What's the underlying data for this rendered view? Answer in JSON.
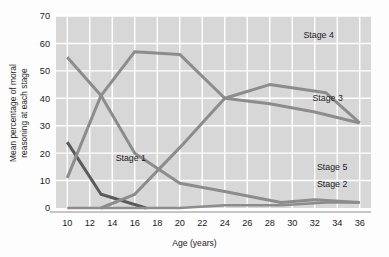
{
  "chart_data": {
    "type": "line",
    "title": "",
    "xlabel": "Age (years)",
    "ylabel": "Mean percentage of moral reasoning at each stage",
    "ylabel_line1": "Mean percentage of moral",
    "ylabel_line2": "reasoning at each stage",
    "xlim": [
      9,
      37
    ],
    "ylim": [
      0,
      70
    ],
    "xticks": [
      10,
      12,
      14,
      16,
      18,
      20,
      22,
      24,
      26,
      28,
      30,
      32,
      34,
      36
    ],
    "yticks": [
      0,
      10,
      20,
      30,
      40,
      50,
      60,
      70
    ],
    "grid": true,
    "legend_position": "inline-right",
    "plot_background": "#d7d7d7",
    "series": [
      {
        "name": "Stage 1",
        "label": "Stage 1",
        "color": "#5a5a5a",
        "label_x": 14.3,
        "label_y": 17,
        "x": [
          10,
          13,
          17
        ],
        "values": [
          24,
          5,
          0
        ]
      },
      {
        "name": "Stage 2",
        "label": "Stage 2",
        "color": "#8c8c8c",
        "label_x": 32.2,
        "label_y": 7.5,
        "x": [
          10,
          13,
          16,
          20,
          24,
          29,
          32,
          36
        ],
        "values": [
          55,
          41,
          20,
          9,
          6,
          2,
          3,
          2
        ]
      },
      {
        "name": "Stage 3",
        "label": "Stage 3",
        "color": "#8c8c8c",
        "label_x": 31.8,
        "label_y": 39,
        "x": [
          10,
          13,
          16,
          20,
          24,
          28,
          33,
          36
        ],
        "values": [
          11,
          41,
          57,
          56,
          40,
          45,
          42,
          31
        ]
      },
      {
        "name": "Stage 4",
        "label": "Stage 4",
        "color": "#8c8c8c",
        "label_x": 31.0,
        "label_y": 62,
        "x": [
          13,
          16,
          20,
          24,
          28,
          32,
          36
        ],
        "values": [
          0,
          5,
          22,
          40,
          38,
          35,
          31
        ]
      },
      {
        "name": "Stage 5",
        "label": "Stage 5",
        "color": "#8c8c8c",
        "label_x": 32.2,
        "label_y": 14,
        "x": [
          10,
          20,
          24,
          29,
          33,
          36
        ],
        "values": [
          0,
          0,
          1,
          1,
          2,
          2
        ]
      }
    ]
  },
  "axes": {
    "x_title": "Age (years)",
    "y_title_line1": "Mean percentage of moral",
    "y_title_line2": "reasoning at each stage",
    "x_tick_labels": [
      "10",
      "12",
      "14",
      "16",
      "18",
      "20",
      "22",
      "24",
      "26",
      "28",
      "30",
      "32",
      "34",
      "36"
    ],
    "y_tick_labels": [
      "0",
      "10",
      "20",
      "30",
      "40",
      "50",
      "60",
      "70"
    ]
  },
  "labels": {
    "stage1": "Stage 1",
    "stage2": "Stage 2",
    "stage3": "Stage 3",
    "stage4": "Stage 4",
    "stage5": "Stage 5"
  }
}
